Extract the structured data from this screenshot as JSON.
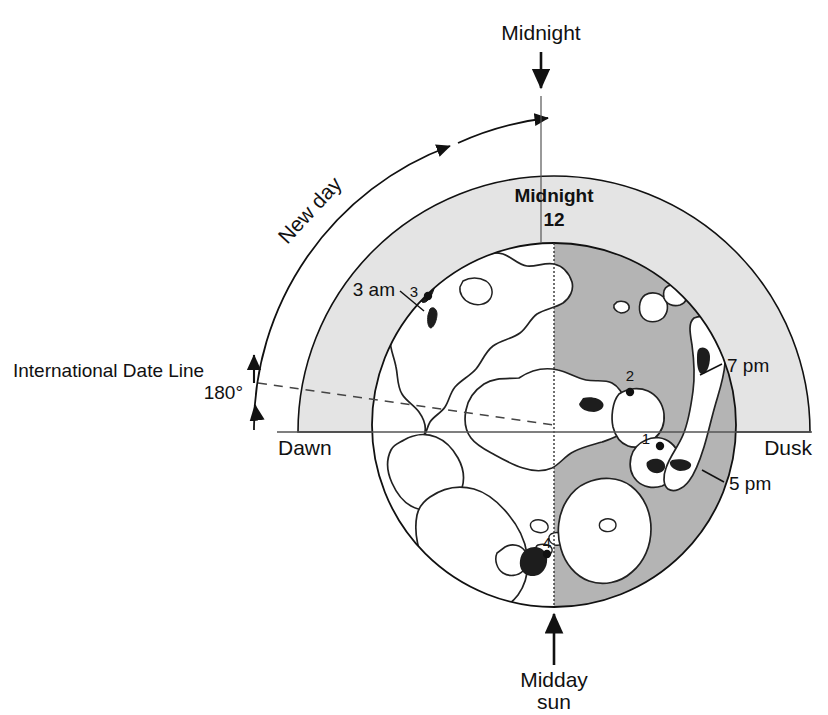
{
  "figure": {
    "type": "diagram",
    "colors": {
      "outline": "#111111",
      "light_band": "#e4e4e4",
      "globe_night": "#b4b4b4",
      "globe_land": "#ffffff",
      "background": "#ffffff"
    }
  },
  "labels": {
    "midnight_top": "Midnight",
    "new_day": "New day",
    "midnight_center": "Midnight",
    "midnight_hour": "12",
    "three_am": "3 am",
    "seven_pm": "7 pm",
    "five_pm": "5 pm",
    "dawn": "Dawn",
    "dusk": "Dusk",
    "idl_line1": "International Date Line",
    "idl_line2": "180°",
    "midday_line1": "Midday",
    "midday_line2": "sun"
  },
  "markers": [
    {
      "id": "1",
      "label": "1"
    },
    {
      "id": "2",
      "label": "2"
    },
    {
      "id": "3",
      "label": "3"
    },
    {
      "id": "4",
      "label": "4"
    }
  ],
  "geometry": {
    "globe_center_x": 554,
    "globe_center_y": 425,
    "globe_radius": 182,
    "band_radius": 256,
    "outer_arc_radius": 300
  }
}
